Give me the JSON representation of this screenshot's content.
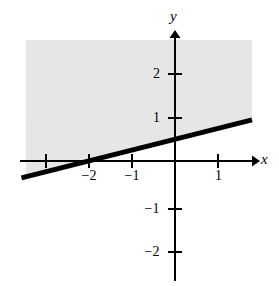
{
  "chart_data": {
    "type": "line",
    "title": "",
    "subtitle": "",
    "xlabel": "x",
    "ylabel": "y",
    "xlim": [
      -3.55,
      1.9
    ],
    "ylim": [
      -2.75,
      3.0
    ],
    "grid": false,
    "legend": null,
    "axes": {
      "x_axis_label": "x",
      "y_axis_label": "y",
      "x_ticks": [
        -3,
        -2,
        -1,
        1
      ],
      "x_tick_labels": [
        "",
        "−2",
        "−1",
        "1"
      ],
      "y_ticks": [
        2,
        1,
        -1,
        -2
      ],
      "y_tick_labels": [
        "2",
        "1",
        "−1",
        "−2"
      ],
      "origin_label": ""
    },
    "series": [
      {
        "name": "boundary-line",
        "type": "line",
        "equation": "y = x/4 + 1/2",
        "slope": 0.25,
        "y_intercept": 0.5,
        "x_intercept": -2,
        "style": "solid",
        "color": "#000000",
        "linewidth": 5,
        "points": [
          [
            -3.55,
            -0.3875
          ],
          [
            1.78,
            0.945
          ]
        ]
      }
    ],
    "shaded_region": {
      "name": "solution-region",
      "description": "region above the line y = x/4 + 1/2",
      "inequality": "y ≥ x/4 + 1/2",
      "color": "#e6e6e6",
      "x_range": [
        -3.45,
        1.78
      ],
      "y_top": 2.78
    },
    "annotations": []
  },
  "labels": {
    "x_axis": "x",
    "y_axis": "y",
    "x_neg2": "−2",
    "x_neg1": "−1",
    "x_pos1": "1",
    "y_pos2": "2",
    "y_pos1": "1",
    "y_neg1": "−1",
    "y_neg2": "−2"
  },
  "colors": {
    "axis": "#000000",
    "line": "#000000",
    "shading": "#e6e6e6",
    "background": "#ffffff",
    "text": "#000000"
  }
}
